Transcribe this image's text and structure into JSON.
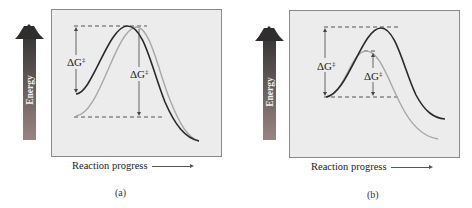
{
  "figure": {
    "type": "reaction energy diagrams",
    "panels": [
      {
        "id": "a",
        "caption": "(a)",
        "y_axis_label": "Energy",
        "x_axis_label": "Reaction progress",
        "annotations": [
          "ΔG‡",
          "ΔG‡"
        ],
        "description": "Dark curve starts higher (destabilized reactant) with same transition state energy; light curve starts lower with larger barrier",
        "curves": [
          {
            "name": "dark",
            "color": "#2a2a2a"
          },
          {
            "name": "light",
            "color": "#a8a8a8"
          }
        ]
      },
      {
        "id": "b",
        "caption": "(b)",
        "y_axis_label": "Energy",
        "x_axis_label": "Reaction progress",
        "annotations": [
          "ΔG‡",
          "ΔG‡"
        ],
        "description": "Both curves start at same energy; light curve has lower transition state (stabilized) giving smaller barrier",
        "curves": [
          {
            "name": "dark",
            "color": "#2a2a2a"
          },
          {
            "name": "light",
            "color": "#a8a8a8"
          }
        ]
      }
    ],
    "delta_g_symbol": "ΔG",
    "double_dagger": "‡",
    "colors": {
      "box_fill": "#ececec",
      "box_border": "#8a8a8a",
      "arrow_top": "#2e2e2e",
      "arrow_bottom": "#9a8585",
      "dark_curve": "#2a2a2a",
      "light_curve": "#a8a8a8"
    }
  }
}
